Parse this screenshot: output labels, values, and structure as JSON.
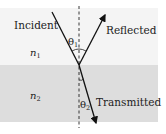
{
  "diagram": {
    "labels": {
      "incident": "Incident",
      "reflected": "Reflected",
      "transmitted": "Transmitted",
      "n1": "n",
      "n1_sub": "1",
      "n2": "n",
      "n2_sub": "2",
      "theta1": "θ",
      "theta1_sub": "1",
      "theta2": "θ",
      "theta2_sub": "2"
    },
    "colors": {
      "medium1": "#f4f4f4",
      "medium2": "#dddddd",
      "ray": "#111111"
    }
  }
}
